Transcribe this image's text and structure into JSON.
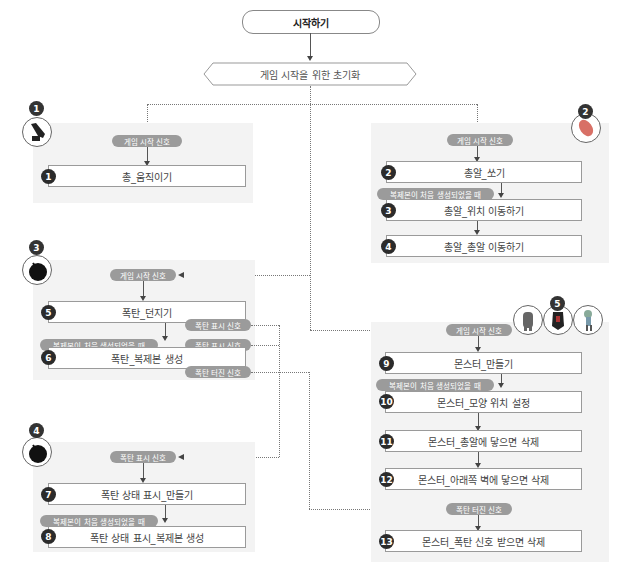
{
  "start": {
    "label": "시작하기"
  },
  "init": {
    "label": "게임 시작을 위한 초기화"
  },
  "signals": {
    "game_start": "게임 시작 신호",
    "clone_start": "복제본이 처음 생성되었을 때",
    "bomb_show": "폭탄 표시 신호",
    "bomb_explode": "폭탄 터진 신호"
  },
  "sections": [
    {
      "badge": "1",
      "sprite": "gun-icon",
      "steps": [
        {
          "num": "1",
          "label": "총_움직이기"
        }
      ]
    },
    {
      "badge": "2",
      "sprite": "bullet-icon",
      "steps": [
        {
          "num": "2",
          "label": "총알_쏘기"
        },
        {
          "num": "3",
          "label": "총알_위치 이동하기"
        },
        {
          "num": "4",
          "label": "총알_총알 이동하기"
        }
      ]
    },
    {
      "badge": "3",
      "sprite": "bomb-icon",
      "steps": [
        {
          "num": "5",
          "label": "폭탄_던지기"
        },
        {
          "num": "6",
          "label": "폭탄_복제본 생성"
        }
      ]
    },
    {
      "badge": "4",
      "sprite": "bomb-icon",
      "steps": [
        {
          "num": "7",
          "label": "폭탄 상태 표시_만들기"
        },
        {
          "num": "8",
          "label": "폭탄 상태 표시_복제본 생성"
        }
      ]
    },
    {
      "badge": "5",
      "sprite": "monster-icons",
      "steps": [
        {
          "num": "9",
          "label": "몬스터_만들기"
        },
        {
          "num": "10",
          "label": "몬스터_모양 위치 설정"
        },
        {
          "num": "11",
          "label": "몬스터_총알에 닿으면 삭제"
        },
        {
          "num": "12",
          "label": "몬스터_아래쪽 벽에 닿으면 삭제"
        },
        {
          "num": "13",
          "label": "몬스터_폭탄 신호 받으면 삭제"
        }
      ]
    }
  ]
}
